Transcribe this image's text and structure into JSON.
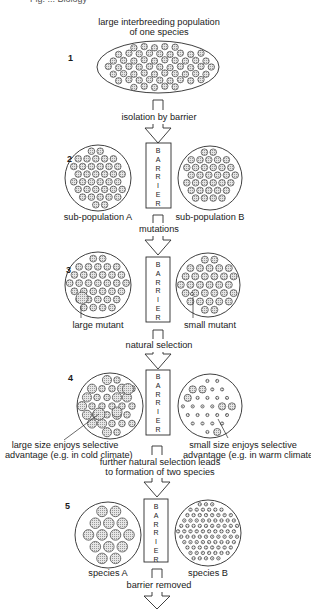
{
  "header_fragment": "Fig. ... Biology",
  "title": {
    "line1": "large interbreeding population",
    "line2": "of one species"
  },
  "stages": [
    {
      "number": "1"
    },
    {
      "number": "2",
      "left_label": "sub-population A",
      "right_label": "sub-population B"
    },
    {
      "number": "3",
      "left_label": "large mutant",
      "right_label": "small mutant"
    },
    {
      "number": "4",
      "left_label_line1": "large size enjoys selective",
      "left_label_line2": "advantage (e.g. in cold climate)",
      "right_label_line1": "small size enjoys selective",
      "right_label_line2": "advantage (e.g. in warm climate)"
    },
    {
      "number": "5",
      "left_label": "species A",
      "right_label": "species B"
    }
  ],
  "transitions": [
    {
      "label": "isolation by barrier"
    },
    {
      "label": "mutations"
    },
    {
      "label": "natural selection"
    },
    {
      "label_line1": "further natural selection leads",
      "label_line2": "to formation of two species"
    },
    {
      "label": "barrier removed"
    }
  ],
  "barrier_text": [
    "B",
    "A",
    "R",
    "R",
    "I",
    "E",
    "R"
  ],
  "colors": {
    "stroke": "#2a2a2a",
    "dot_fill": "#c8c8c8",
    "background": "#ffffff"
  }
}
